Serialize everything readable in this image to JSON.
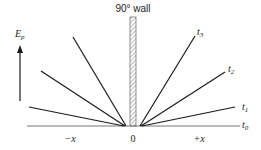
{
  "diagram": {
    "wall_label": "90° wall",
    "y_axis_label": "E",
    "y_axis_subscript": "p",
    "x_labels": {
      "neg": "−x",
      "zero": "0",
      "pos": "+x"
    },
    "time_labels": [
      {
        "t": "t",
        "sub": "0"
      },
      {
        "t": "t",
        "sub": "1"
      },
      {
        "t": "t",
        "sub": "2"
      },
      {
        "t": "t",
        "sub": "3"
      }
    ],
    "colors": {
      "line": "#1a1a1a",
      "baseline": "#555555",
      "wall_hatch": "#666666"
    }
  }
}
